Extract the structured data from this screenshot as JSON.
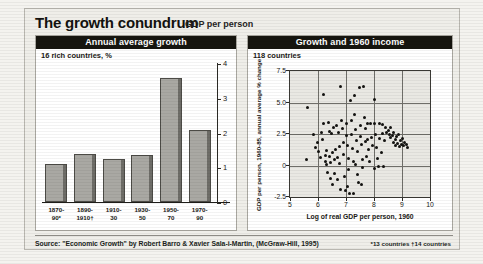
{
  "header": {
    "title": "The growth conundrum",
    "subtitle": "GDP per person"
  },
  "left_panel": {
    "heading": "Annual average growth",
    "note": "16 rich countries, %"
  },
  "right_panel": {
    "heading": "Growth and 1960 income",
    "note": "118 countries"
  },
  "footer": {
    "source": "Source: \"Economic Growth\" by Robert Barro & Xavier Sala-i-Martin, (McGraw-Hill, 1995)",
    "notes": "*13 countries  †14 countries"
  },
  "chart_data": [
    {
      "type": "bar",
      "title": "Annual average growth",
      "subtitle": "16 rich countries, %",
      "categories": [
        "1870-90*",
        "1890-1910†",
        "1910-30",
        "1930-50",
        "1950-70",
        "1970-90"
      ],
      "category_lines": [
        [
          "1870-",
          "90*"
        ],
        [
          "1890-",
          "1910†"
        ],
        [
          "1910-",
          "30"
        ],
        [
          "1930-",
          "50"
        ],
        [
          "1950-",
          "70"
        ],
        [
          "1970-",
          "90"
        ]
      ],
      "values": [
        1.1,
        1.4,
        1.25,
        1.35,
        3.6,
        2.1
      ],
      "xlabel": "",
      "ylabel": "%",
      "ylim": [
        0,
        4
      ],
      "yticks": [
        0,
        1,
        2,
        3,
        4
      ],
      "ytick_labels": [
        "0",
        "1",
        "2",
        "3",
        "4"
      ],
      "grid": false,
      "bar_color": "#a9a8a3",
      "axis_position": "right"
    },
    {
      "type": "scatter",
      "title": "Growth and 1960 income",
      "subtitle": "118 countries",
      "xlabel": "Log of real GDP per person, 1960",
      "ylabel": "GDP per person, 1960-85, annual average % change",
      "xlim": [
        5,
        10
      ],
      "ylim": [
        -2.5,
        7.5
      ],
      "xticks": [
        5,
        6,
        7,
        8,
        9,
        10
      ],
      "xtick_labels": [
        "5",
        "6",
        "7",
        "8",
        "9",
        "10"
      ],
      "yticks": [
        -2.5,
        0,
        2.5,
        5.0,
        7.5
      ],
      "ytick_labels": [
        "-2.5",
        "0",
        "2.5",
        "5.0",
        "7.5"
      ],
      "grid": true,
      "point_color": "#131210",
      "points": [
        [
          5.62,
          4.6
        ],
        [
          5.58,
          0.5
        ],
        [
          5.85,
          2.5
        ],
        [
          5.92,
          1.45
        ],
        [
          6.02,
          1.1
        ],
        [
          6.08,
          0.6
        ],
        [
          6.12,
          2.6
        ],
        [
          6.18,
          3.3
        ],
        [
          6.2,
          5.6
        ],
        [
          6.25,
          0.8
        ],
        [
          6.28,
          0.3
        ],
        [
          6.3,
          1.2
        ],
        [
          6.32,
          0.05
        ],
        [
          6.35,
          -0.55
        ],
        [
          6.38,
          3.4
        ],
        [
          6.4,
          2.7
        ],
        [
          6.42,
          0.75
        ],
        [
          6.45,
          0.2
        ],
        [
          6.48,
          2.55
        ],
        [
          6.5,
          1.05
        ],
        [
          6.52,
          -1.5
        ],
        [
          6.55,
          3.05
        ],
        [
          6.58,
          0.45
        ],
        [
          6.6,
          -0.6
        ],
        [
          6.62,
          1.3
        ],
        [
          6.65,
          3.2
        ],
        [
          6.68,
          0.6
        ],
        [
          6.7,
          -1.15
        ],
        [
          6.72,
          2.6
        ],
        [
          6.75,
          1.5
        ],
        [
          6.78,
          0.15
        ],
        [
          6.8,
          -1.9
        ],
        [
          6.82,
          6.3
        ],
        [
          6.85,
          3.55
        ],
        [
          6.88,
          2.9
        ],
        [
          6.9,
          1.8
        ],
        [
          6.92,
          0.9
        ],
        [
          6.95,
          -0.9
        ],
        [
          6.98,
          -2.0
        ],
        [
          7.0,
          3.3
        ],
        [
          7.02,
          2.35
        ],
        [
          7.05,
          1.6
        ],
        [
          7.08,
          0.55
        ],
        [
          7.1,
          -0.35
        ],
        [
          7.12,
          -2.25
        ],
        [
          7.15,
          5.15
        ],
        [
          7.18,
          3.6
        ],
        [
          7.2,
          2.45
        ],
        [
          7.22,
          1.35
        ],
        [
          7.25,
          0.3
        ],
        [
          7.28,
          -2.2
        ],
        [
          7.3,
          5.55
        ],
        [
          7.32,
          4.05
        ],
        [
          7.35,
          2.85
        ],
        [
          7.38,
          2.0
        ],
        [
          7.4,
          1.15
        ],
        [
          7.42,
          -0.7
        ],
        [
          7.45,
          -1.35
        ],
        [
          7.48,
          6.2
        ],
        [
          7.5,
          3.15
        ],
        [
          7.52,
          2.3
        ],
        [
          7.55,
          1.7
        ],
        [
          7.58,
          0.45
        ],
        [
          7.6,
          -0.15
        ],
        [
          7.62,
          6.25
        ],
        [
          7.65,
          3.8
        ],
        [
          7.68,
          2.95
        ],
        [
          7.7,
          1.9
        ],
        [
          7.72,
          0.7
        ],
        [
          7.75,
          3.35
        ],
        [
          7.78,
          2.1
        ],
        [
          7.8,
          1.25
        ],
        [
          7.85,
          0.35
        ],
        [
          7.88,
          3.3
        ],
        [
          7.9,
          2.2
        ],
        [
          7.95,
          1.55
        ],
        [
          8.0,
          5.25
        ],
        [
          8.02,
          3.3
        ],
        [
          8.05,
          2.5
        ],
        [
          8.08,
          1.4
        ],
        [
          8.12,
          0.55
        ],
        [
          8.15,
          -0.1
        ],
        [
          8.18,
          3.35
        ],
        [
          8.2,
          2.15
        ],
        [
          8.25,
          1.05
        ],
        [
          8.3,
          3.25
        ],
        [
          8.32,
          2.55
        ],
        [
          8.38,
          2.0
        ],
        [
          8.4,
          3.0
        ],
        [
          8.45,
          2.6
        ],
        [
          8.5,
          2.75
        ],
        [
          8.55,
          2.45
        ],
        [
          8.58,
          2.25
        ],
        [
          8.6,
          3.0
        ],
        [
          8.65,
          2.35
        ],
        [
          8.68,
          1.85
        ],
        [
          8.7,
          2.6
        ],
        [
          8.75,
          2.05
        ],
        [
          8.78,
          1.6
        ],
        [
          8.8,
          2.3
        ],
        [
          8.85,
          1.75
        ],
        [
          8.88,
          2.45
        ],
        [
          8.9,
          1.5
        ],
        [
          8.95,
          1.95
        ],
        [
          8.98,
          1.65
        ],
        [
          9.0,
          2.15
        ],
        [
          9.05,
          1.55
        ],
        [
          9.1,
          1.85
        ],
        [
          9.15,
          1.7
        ],
        [
          9.18,
          1.45
        ],
        [
          8.35,
          -0.05
        ],
        [
          8.02,
          -0.25
        ],
        [
          7.55,
          -1.5
        ],
        [
          7.05,
          -1.65
        ],
        [
          6.45,
          -1.05
        ],
        [
          6.15,
          2.1
        ],
        [
          5.98,
          1.8
        ],
        [
          7.35,
          0.05
        ]
      ]
    }
  ]
}
